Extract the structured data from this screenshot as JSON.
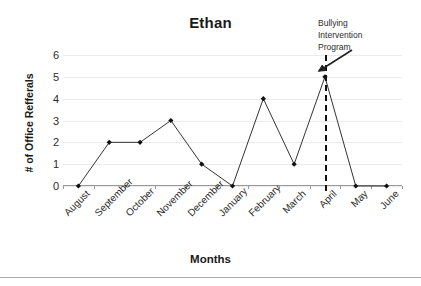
{
  "chart_data": {
    "type": "line",
    "title": "Ethan",
    "xlabel": "Months",
    "ylabel": "# of Office Refferals",
    "categories": [
      "August",
      "September",
      "October",
      "November",
      "December",
      "January",
      "February",
      "March",
      "April",
      "May",
      "June"
    ],
    "values": [
      0,
      2,
      2,
      3,
      1,
      0,
      4,
      1,
      5,
      0,
      0
    ],
    "ylim": [
      0,
      6
    ],
    "yticks": [
      0,
      1,
      2,
      3,
      4,
      5,
      6
    ],
    "ytick_labels": [
      "0",
      "1",
      "2",
      "3",
      "4",
      "5",
      "6"
    ],
    "grid": true,
    "legend": false,
    "series": [
      {
        "name": "Office Referrals",
        "values": [
          0,
          2,
          2,
          3,
          1,
          0,
          4,
          1,
          5,
          0,
          0
        ],
        "line_color": "#333333",
        "marker": "diamond",
        "marker_color": "#111111"
      }
    ],
    "annotations": [
      {
        "name": "bullying-intervention-program",
        "text": "Bullying Intervention Program",
        "lines": [
          "Bullying",
          "Intervention",
          "Program"
        ],
        "at_category": "April",
        "style": "vertical-dashed-line-with-arrow",
        "line_color": "#111111",
        "arrow_color": "#222222"
      }
    ]
  },
  "colors": {
    "background": "#ffffff",
    "gridline": "#ebebeb",
    "axis": "#9a9a9a",
    "text": "#1a1a1a",
    "series_line": "#333333",
    "marker": "#111111",
    "annotation_line": "#111111",
    "bottom_rule": "#a8a8a8"
  }
}
